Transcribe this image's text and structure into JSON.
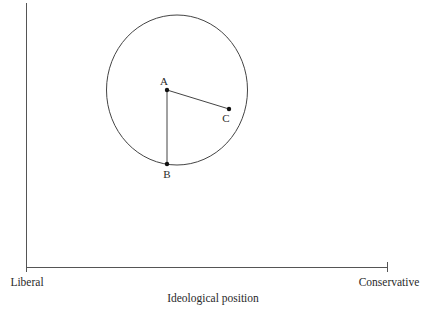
{
  "diagram": {
    "x_axis": {
      "title": "Ideological position",
      "left_label": "Liberal",
      "right_label": "Conservative"
    },
    "points": [
      {
        "label": "A"
      },
      {
        "label": "B"
      },
      {
        "label": "C"
      }
    ],
    "segments": [
      "A-B",
      "A-C"
    ],
    "shape": "circle centered near A passing through B",
    "colors": {
      "ink": "#2a2a2a",
      "background": "#ffffff"
    }
  }
}
